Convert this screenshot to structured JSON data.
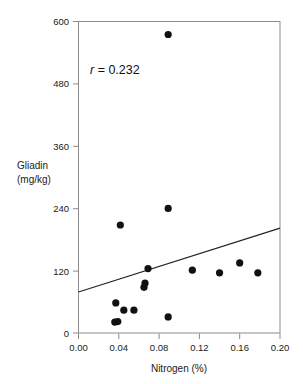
{
  "chart_data": {
    "type": "scatter",
    "title": "",
    "xlabel": "Nitrogen (%)",
    "ylabel": "Gliadin (mg/kg)",
    "ylabel_line1": "Gliadin",
    "ylabel_line2": "(mg/kg)",
    "xlim": [
      0.0,
      0.2
    ],
    "ylim": [
      0,
      600
    ],
    "xticks": [
      0.0,
      0.04,
      0.08,
      0.12,
      0.16,
      0.2
    ],
    "xtick_labels": [
      "0.00",
      "0.04",
      "0.08",
      "0.12",
      "0.16",
      "0.20"
    ],
    "yticks": [
      0,
      120,
      240,
      360,
      480,
      600
    ],
    "ytick_labels": [
      "0",
      "120",
      "240",
      "360",
      "480",
      "600"
    ],
    "grid": false,
    "legend": false,
    "annotations": [
      {
        "name": "correlation-annotation",
        "symbol": "r",
        "text": " = 0.232",
        "full_text": "r = 0.232",
        "x": 0.022,
        "y": 520
      }
    ],
    "series": [
      {
        "name": "samples",
        "marker": "filled-circle",
        "color": "#111111",
        "points": [
          {
            "x": 0.036,
            "y": 21
          },
          {
            "x": 0.039,
            "y": 22
          },
          {
            "x": 0.037,
            "y": 58
          },
          {
            "x": 0.0415,
            "y": 208
          },
          {
            "x": 0.045,
            "y": 44
          },
          {
            "x": 0.055,
            "y": 44
          },
          {
            "x": 0.065,
            "y": 88
          },
          {
            "x": 0.066,
            "y": 96
          },
          {
            "x": 0.069,
            "y": 124
          },
          {
            "x": 0.089,
            "y": 31
          },
          {
            "x": 0.089,
            "y": 240
          },
          {
            "x": 0.089,
            "y": 575
          },
          {
            "x": 0.113,
            "y": 121
          },
          {
            "x": 0.14,
            "y": 116
          },
          {
            "x": 0.16,
            "y": 135
          },
          {
            "x": 0.178,
            "y": 116
          }
        ]
      }
    ],
    "fit_line": {
      "name": "regression-line",
      "x0": 0.0,
      "y0": 79,
      "x1": 0.2,
      "y1": 202,
      "color": "#222222"
    }
  },
  "colors": {
    "axis": "#8c8c8c",
    "text": "#1a1a1a",
    "marker": "#111111",
    "background": "#ffffff"
  }
}
